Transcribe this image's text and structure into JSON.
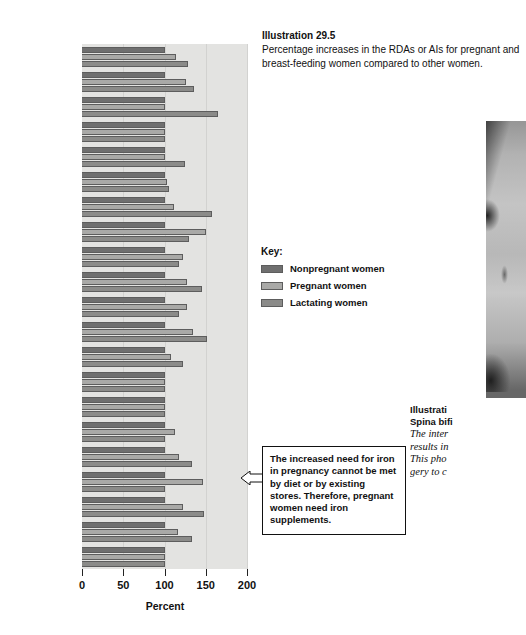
{
  "caption": {
    "number": "Illustration 29.5",
    "text": "Percentage increases in the RDAs or AIs for pregnant and breast-feeding women compared to other women."
  },
  "legend": {
    "title": "Key:",
    "items": [
      {
        "label": "Nonpregnant women",
        "color": "#6f6f6f"
      },
      {
        "label": "Pregnant women",
        "color": "#a9a9a7"
      },
      {
        "label": "Lactating women",
        "color": "#8b8b89"
      }
    ]
  },
  "callout": {
    "text": "The increased need for iron in pregnancy cannot be met by diet or by existing stores. Therefore, pregnant women need iron supplements."
  },
  "photo_caption": {
    "line1": "Illustrati",
    "line2": "Spina bifi",
    "line3": "The inter",
    "line4": "results in",
    "line5": "This pho",
    "line6": "gery to c"
  },
  "chart_data": {
    "type": "bar",
    "orientation": "horizontal",
    "title": "",
    "xlabel": "Percent",
    "ylabel": "",
    "xlim": [
      0,
      200
    ],
    "xticks": [
      0,
      50,
      100,
      150,
      200
    ],
    "grid": true,
    "grid_axis": "x",
    "categories": [
      "Energy",
      "Protein",
      "Vitamin A",
      "Vitamin D",
      "Vitamin E",
      "Vitamin K",
      "Vitamin C",
      "Folate",
      "Niacin",
      "Riboflavin",
      "Thiamin",
      "Vitamin B6",
      "Vitamin B12",
      "Calcium",
      "Phosphorus",
      "Magnesium",
      "Iodine",
      "Iron",
      "Zinc",
      "Selenium",
      "Fluoride"
    ],
    "category_labels_html": [
      "Energy",
      "Protein",
      "Vitamin A",
      "Vitamin D",
      "Vitamin E",
      "Vitamin K",
      "Vitamin C",
      "Folate",
      "Niacin",
      "Riboflavin",
      "Thiamin",
      "Vitamin B<sub>6</sub>",
      "Vitamin B<sub>12</sub>",
      "Calcium",
      "Phosphorus",
      "Magnesium",
      "Iodine",
      "Iron",
      "Zinc",
      "Selenium",
      "Fluoride"
    ],
    "series": [
      {
        "name": "Nonpregnant women",
        "color": "#6f6f6f",
        "values": [
          100,
          100,
          100,
          100,
          100,
          100,
          100,
          100,
          100,
          100,
          100,
          100,
          100,
          100,
          100,
          100,
          100,
          100,
          100,
          100,
          100
        ]
      },
      {
        "name": "Pregnant women",
        "color": "#a9a9a7",
        "values": [
          114,
          126,
          100,
          100,
          100,
          103,
          112,
          150,
          122,
          127,
          127,
          135,
          108,
          100,
          100,
          113,
          117,
          147,
          123,
          116,
          100
        ]
      },
      {
        "name": "Lactating women",
        "color": "#8b8b89",
        "values": [
          128,
          136,
          165,
          100,
          125,
          105,
          157,
          130,
          117,
          145,
          117,
          152,
          122,
          100,
          100,
          100,
          133,
          100,
          148,
          133,
          100
        ]
      }
    ]
  }
}
